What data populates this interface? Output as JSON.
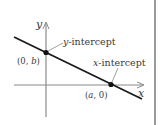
{
  "diagram": {
    "axes": {
      "x_label": "x",
      "y_label": "y"
    },
    "labels": {
      "y_intercept": {
        "var": "y",
        "text": "-intercept"
      },
      "x_intercept": {
        "var": "x",
        "text": "-intercept"
      },
      "y_point": {
        "open": "(0, ",
        "var": "b",
        "close": ")"
      },
      "x_point": {
        "open": "(",
        "var": "a",
        "close": ", 0)"
      }
    },
    "colors": {
      "axis": "#8a8a8a",
      "line": "#1a1a1a",
      "point": "#111111",
      "text": "#3a3a3a",
      "border": "#9a9a9a"
    }
  }
}
